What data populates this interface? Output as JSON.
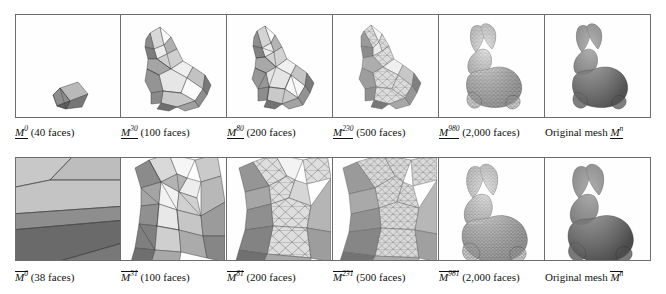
{
  "figure": {
    "background_color": "#ffffff",
    "panel_border_color": "#6d6d6d",
    "rows": [
      {
        "name": "top-row",
        "description": "Full view of bunny mesh at increasing resolution",
        "cells": [
          {
            "mesh_symbol": "M",
            "symbol_style": "underline",
            "superscript": "0",
            "faces_label": "(40 faces)",
            "caption": "M0 (40 faces)",
            "model": "coarse-tetra"
          },
          {
            "mesh_symbol": "M",
            "symbol_style": "underline",
            "superscript": "30",
            "faces_label": "(100 faces)",
            "caption": "M30 (100 faces)",
            "model": "bunny-100"
          },
          {
            "mesh_symbol": "M",
            "symbol_style": "underline",
            "superscript": "80",
            "faces_label": "(200 faces)",
            "caption": "M80 (200 faces)",
            "model": "bunny-200"
          },
          {
            "mesh_symbol": "M",
            "symbol_style": "underline",
            "superscript": "230",
            "faces_label": "(500 faces)",
            "caption": "M230 (500 faces)",
            "model": "bunny-500"
          },
          {
            "mesh_symbol": "M",
            "symbol_style": "underline",
            "superscript": "980",
            "faces_label": "(2,000 faces)",
            "caption": "M980 (2,000 faces)",
            "model": "bunny-2000"
          },
          {
            "mesh_symbol": "M",
            "symbol_style": "underline",
            "superscript": "n",
            "faces_label": "",
            "prefix": "Original mesh ",
            "caption": "Original mesh Mn",
            "model": "bunny-original"
          }
        ]
      },
      {
        "name": "bottom-row",
        "description": "Close-up view of bunny mesh at increasing resolution",
        "cells": [
          {
            "mesh_symbol": "M",
            "symbol_style": "overline",
            "superscript": "0",
            "faces_label": "(38 faces)",
            "caption": "M0 (38 faces)",
            "model": "closeup-38"
          },
          {
            "mesh_symbol": "M",
            "symbol_style": "overline",
            "superscript": "31",
            "faces_label": "(100 faces)",
            "caption": "M31 (100 faces)",
            "model": "closeup-100"
          },
          {
            "mesh_symbol": "M",
            "symbol_style": "overline",
            "superscript": "81",
            "faces_label": "(200 faces)",
            "caption": "M81 (200 faces)",
            "model": "closeup-200"
          },
          {
            "mesh_symbol": "M",
            "symbol_style": "overline",
            "superscript": "231",
            "faces_label": "(500 faces)",
            "caption": "M231 (500 faces)",
            "model": "closeup-500"
          },
          {
            "mesh_symbol": "M",
            "symbol_style": "overline",
            "superscript": "981",
            "faces_label": "(2,000 faces)",
            "caption": "M981 (2,000 faces)",
            "model": "closeup-2000"
          },
          {
            "mesh_symbol": "M",
            "symbol_style": "overline",
            "superscript": "n",
            "faces_label": "",
            "prefix": "Original mesh ",
            "caption": "Original mesh Mn",
            "model": "closeup-original"
          }
        ]
      }
    ]
  }
}
